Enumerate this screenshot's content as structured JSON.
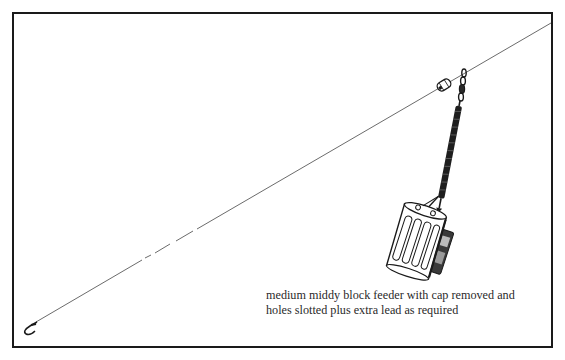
{
  "figure": {
    "caption": {
      "line1": "medium middy block feeder with cap removed and",
      "line2": "holes slotted plus extra lead as required"
    },
    "components": [
      "fishing-line",
      "bead",
      "swivel",
      "spring-boom",
      "block-feeder",
      "hook"
    ],
    "colors": {
      "ink": "#1a1a1a",
      "line": "#555555",
      "background": "#ffffff"
    }
  }
}
